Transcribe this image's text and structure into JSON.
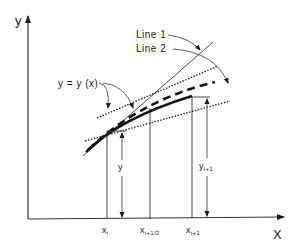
{
  "diagram": {
    "axes": {
      "y_label": "y",
      "x_label": "X"
    },
    "callouts": {
      "line1": "Line 1",
      "line2": "Line 2",
      "curve": "y = y (x)"
    },
    "x_ticks": [
      {
        "base": "x",
        "sub": "i"
      },
      {
        "base": "x",
        "sub": "i+1/2"
      },
      {
        "base": "x",
        "sub": "i+1"
      }
    ],
    "dimensions": {
      "y_at_xi": "y",
      "y_at_xi1_base": "y",
      "y_at_xi1_sub": "i+1"
    },
    "colors": {
      "ink": "#1a1a1a",
      "background": "#ffffff"
    }
  }
}
